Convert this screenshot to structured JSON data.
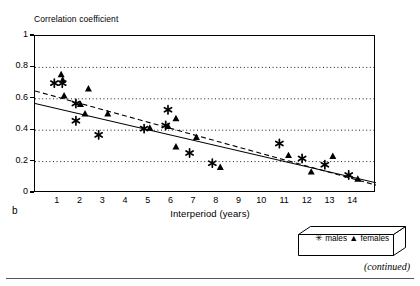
{
  "figure": {
    "panel_letter": "b",
    "continued_note": "(continued)"
  },
  "chart_data": {
    "type": "scatter",
    "title": "",
    "ylabel": "Correlation coefficient",
    "xlabel": "Interperiod (years)",
    "xlim": [
      0,
      15
    ],
    "ylim": [
      0,
      1
    ],
    "grid": "horizontal-dotted",
    "xticks": [
      1,
      2,
      3,
      4,
      5,
      6,
      7,
      8,
      9,
      10,
      11,
      12,
      13,
      14
    ],
    "xtick_labels": [
      "1",
      "2",
      "3",
      "4",
      "5",
      "6",
      "7",
      "8",
      "9",
      "10",
      "11",
      "12",
      "13",
      "14"
    ],
    "yticks": [
      0,
      0.2,
      0.4,
      0.6,
      0.8,
      1
    ],
    "ytick_labels": [
      "0",
      "0.2",
      "0.4",
      "0.6",
      "0.8",
      "1"
    ],
    "legend_position": "below-right-outside",
    "series": [
      {
        "name": "males",
        "marker": "asterisk",
        "color": "#000000",
        "points": [
          [
            0.85,
            0.7
          ],
          [
            1.2,
            0.7
          ],
          [
            1.8,
            0.57
          ],
          [
            1.8,
            0.46
          ],
          [
            2.8,
            0.37
          ],
          [
            4.8,
            0.41
          ],
          [
            5.75,
            0.43
          ],
          [
            5.85,
            0.53
          ],
          [
            6.8,
            0.255
          ],
          [
            7.8,
            0.19
          ],
          [
            10.75,
            0.315
          ],
          [
            11.75,
            0.22
          ],
          [
            12.75,
            0.18
          ],
          [
            13.8,
            0.115
          ]
        ],
        "trend": {
          "style": "solid",
          "x": [
            0,
            15
          ],
          "y": [
            0.57,
            0.065
          ]
        }
      },
      {
        "name": "females",
        "marker": "triangle-up",
        "color": "#000000",
        "points": [
          [
            1.15,
            0.755
          ],
          [
            1.22,
            0.72
          ],
          [
            1.28,
            0.62
          ],
          [
            2.0,
            0.565
          ],
          [
            2.2,
            0.505
          ],
          [
            2.35,
            0.665
          ],
          [
            3.2,
            0.505
          ],
          [
            5.05,
            0.415
          ],
          [
            5.85,
            0.425
          ],
          [
            6.2,
            0.475
          ],
          [
            6.2,
            0.295
          ],
          [
            7.1,
            0.355
          ],
          [
            8.15,
            0.165
          ],
          [
            11.15,
            0.24
          ],
          [
            12.15,
            0.135
          ],
          [
            13.1,
            0.235
          ],
          [
            14.2,
            0.09
          ]
        ],
        "trend": {
          "style": "dashed",
          "x": [
            0,
            15
          ],
          "y": [
            0.65,
            0.05
          ]
        }
      }
    ]
  },
  "legend": {
    "males_symbol": "✳",
    "males_label": "males",
    "females_symbol": "▲",
    "females_label": "females"
  }
}
